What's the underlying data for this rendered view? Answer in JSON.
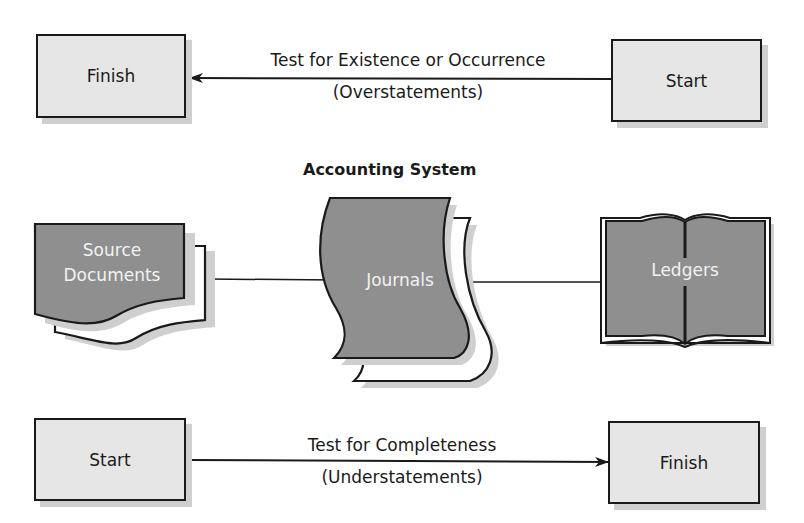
{
  "top_flow": {
    "left_box": "Finish",
    "right_box": "Start",
    "caption_line1": "Test for Existence or Occurrence",
    "caption_line2": "(Overstatements)",
    "arrow_direction": "right-to-left"
  },
  "accounting_system": {
    "title": "Accounting System",
    "source_documents": "Source\nDocuments",
    "source_documents_line1": "Source",
    "source_documents_line2": "Documents",
    "journals": "Journals",
    "ledgers": "Ledgers"
  },
  "bottom_flow": {
    "left_box": "Start",
    "right_box": "Finish",
    "caption_line1": "Test for Completeness",
    "caption_line2": "(Understatements)",
    "arrow_direction": "left-to-right"
  },
  "colors": {
    "box_fill": "#e6e6e6",
    "shape_fill": "#8f8f8f",
    "stroke": "#1a1a1a",
    "shadow": "#cfcfcf"
  }
}
